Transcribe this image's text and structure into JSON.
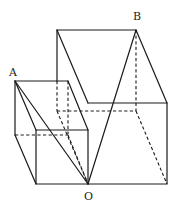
{
  "figure": {
    "type": "geometry-diagram",
    "header_fragment": "",
    "labels": {
      "A": "A",
      "B": "B",
      "O": "O"
    },
    "points": {
      "A": [
        15,
        81
      ],
      "B": [
        136,
        30
      ],
      "O": [
        88,
        184
      ]
    },
    "small_cube": {
      "front_face": [
        [
          36,
          130
        ],
        [
          88,
          130
        ],
        [
          88,
          184
        ],
        [
          36,
          184
        ]
      ],
      "back_face": [
        [
          15,
          81
        ],
        [
          68,
          81
        ],
        [
          68,
          135
        ],
        [
          15,
          135
        ]
      ]
    },
    "large_cube": {
      "front_face": [
        [
          88,
          103
        ],
        [
          167,
          103
        ],
        [
          167,
          184
        ],
        [
          88,
          184
        ]
      ],
      "back_face": [
        [
          57,
          30
        ],
        [
          136,
          30
        ],
        [
          136,
          111
        ],
        [
          57,
          111
        ]
      ]
    },
    "colors": {
      "line": "#1a1a1a",
      "background": "#ffffff"
    }
  }
}
